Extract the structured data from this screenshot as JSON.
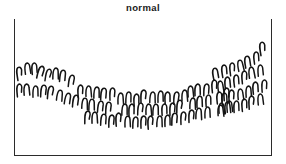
{
  "figure": {
    "title": "normal",
    "width": 286,
    "height": 164,
    "background_color": "#ffffff"
  },
  "axes": {
    "frame_style": "open-top",
    "frame_color": "#2b2b2b",
    "left_px": 14,
    "top_px": 19,
    "width_px": 258,
    "height_px": 137,
    "sides_drawn": [
      "left",
      "right",
      "bottom"
    ],
    "ticks": [],
    "tick_labels": [],
    "xlabel": "",
    "ylabel": ""
  },
  "marker": {
    "glyph_name": "inverted-u-hook",
    "description": "hand drawn inverted U hook stroke",
    "stroke_color": "#141414",
    "stroke_width": 1.5
  },
  "chart_data": {
    "type": "scatter",
    "title": "normal",
    "subtitle": "",
    "xlabel": "",
    "ylabel": "",
    "xlim": [
      0,
      258
    ],
    "ylim": [
      0,
      137
    ],
    "grid": false,
    "legend": null,
    "legend_position": "none",
    "annotations": [],
    "marker_style": "inverted-u-hook",
    "shape": "u-shaped band",
    "n_points": 94,
    "points": [
      {
        "x": 6,
        "y": 55,
        "r": -8,
        "s": 1.02
      },
      {
        "x": 13,
        "y": 50,
        "r": -6,
        "s": 1.0
      },
      {
        "x": 20,
        "y": 50,
        "r": -4,
        "s": 0.98
      },
      {
        "x": 27,
        "y": 54,
        "r": 14,
        "s": 1.04
      },
      {
        "x": 34,
        "y": 56,
        "r": 10,
        "s": 0.96
      },
      {
        "x": 41,
        "y": 55,
        "r": 2,
        "s": 1.0
      },
      {
        "x": 49,
        "y": 58,
        "r": 6,
        "s": 1.02
      },
      {
        "x": 57,
        "y": 62,
        "r": 8,
        "s": 0.98
      },
      {
        "x": 5,
        "y": 71,
        "r": -4,
        "s": 1.0
      },
      {
        "x": 13,
        "y": 72,
        "r": -2,
        "s": 1.02
      },
      {
        "x": 21,
        "y": 73,
        "r": 0,
        "s": 0.98
      },
      {
        "x": 29,
        "y": 72,
        "r": 4,
        "s": 1.0
      },
      {
        "x": 37,
        "y": 74,
        "r": 6,
        "s": 1.02
      },
      {
        "x": 45,
        "y": 77,
        "r": 8,
        "s": 0.98
      },
      {
        "x": 53,
        "y": 80,
        "r": 10,
        "s": 1.0
      },
      {
        "x": 62,
        "y": 83,
        "r": 6,
        "s": 1.02
      },
      {
        "x": 66,
        "y": 72,
        "r": -2,
        "s": 1.0
      },
      {
        "x": 74,
        "y": 73,
        "r": 0,
        "s": 0.98
      },
      {
        "x": 82,
        "y": 74,
        "r": 2,
        "s": 1.0
      },
      {
        "x": 90,
        "y": 76,
        "r": 4,
        "s": 1.02
      },
      {
        "x": 98,
        "y": 75,
        "r": 0,
        "s": 0.98
      },
      {
        "x": 70,
        "y": 85,
        "r": 4,
        "s": 1.0
      },
      {
        "x": 78,
        "y": 87,
        "r": 2,
        "s": 1.02
      },
      {
        "x": 86,
        "y": 88,
        "r": 6,
        "s": 0.98
      },
      {
        "x": 94,
        "y": 89,
        "r": 3,
        "s": 1.0
      },
      {
        "x": 73,
        "y": 98,
        "r": 2,
        "s": 1.0
      },
      {
        "x": 81,
        "y": 100,
        "r": 0,
        "s": 1.02
      },
      {
        "x": 89,
        "y": 101,
        "r": 4,
        "s": 0.98
      },
      {
        "x": 97,
        "y": 102,
        "r": 2,
        "s": 1.0
      },
      {
        "x": 105,
        "y": 101,
        "r": -2,
        "s": 1.02
      },
      {
        "x": 106,
        "y": 80,
        "r": 0,
        "s": 1.0
      },
      {
        "x": 114,
        "y": 79,
        "r": 2,
        "s": 0.98
      },
      {
        "x": 122,
        "y": 81,
        "r": -2,
        "s": 1.0
      },
      {
        "x": 130,
        "y": 78,
        "r": 0,
        "s": 1.02
      },
      {
        "x": 138,
        "y": 79,
        "r": 3,
        "s": 0.98
      },
      {
        "x": 146,
        "y": 78,
        "r": 0,
        "s": 1.0
      },
      {
        "x": 154,
        "y": 80,
        "r": -2,
        "s": 1.02
      },
      {
        "x": 162,
        "y": 79,
        "r": 2,
        "s": 0.98
      },
      {
        "x": 170,
        "y": 77,
        "r": 0,
        "s": 1.0
      },
      {
        "x": 110,
        "y": 91,
        "r": 2,
        "s": 1.0
      },
      {
        "x": 118,
        "y": 92,
        "r": 0,
        "s": 1.02
      },
      {
        "x": 126,
        "y": 90,
        "r": 3,
        "s": 0.98
      },
      {
        "x": 134,
        "y": 91,
        "r": 0,
        "s": 1.0
      },
      {
        "x": 142,
        "y": 92,
        "r": 2,
        "s": 1.02
      },
      {
        "x": 150,
        "y": 91,
        "r": -2,
        "s": 0.98
      },
      {
        "x": 158,
        "y": 90,
        "r": 0,
        "s": 1.0
      },
      {
        "x": 166,
        "y": 88,
        "r": 2,
        "s": 1.02
      },
      {
        "x": 113,
        "y": 103,
        "r": 0,
        "s": 1.0
      },
      {
        "x": 121,
        "y": 104,
        "r": 2,
        "s": 0.98
      },
      {
        "x": 129,
        "y": 103,
        "r": 0,
        "s": 1.0
      },
      {
        "x": 137,
        "y": 104,
        "r": -2,
        "s": 1.02
      },
      {
        "x": 145,
        "y": 103,
        "r": 2,
        "s": 0.98
      },
      {
        "x": 153,
        "y": 102,
        "r": 0,
        "s": 1.0
      },
      {
        "x": 161,
        "y": 101,
        "r": 2,
        "s": 1.02
      },
      {
        "x": 169,
        "y": 99,
        "r": 0,
        "s": 0.98
      },
      {
        "x": 176,
        "y": 73,
        "r": -2,
        "s": 1.0
      },
      {
        "x": 184,
        "y": 72,
        "r": 0,
        "s": 1.02
      },
      {
        "x": 192,
        "y": 71,
        "r": 2,
        "s": 0.98
      },
      {
        "x": 200,
        "y": 67,
        "r": -4,
        "s": 1.0
      },
      {
        "x": 178,
        "y": 85,
        "r": 2,
        "s": 1.0
      },
      {
        "x": 186,
        "y": 84,
        "r": 0,
        "s": 1.02
      },
      {
        "x": 194,
        "y": 82,
        "r": -2,
        "s": 0.98
      },
      {
        "x": 177,
        "y": 97,
        "r": 0,
        "s": 1.0
      },
      {
        "x": 185,
        "y": 96,
        "r": 2,
        "s": 1.02
      },
      {
        "x": 193,
        "y": 94,
        "r": 0,
        "s": 0.98
      },
      {
        "x": 205,
        "y": 79,
        "r": -4,
        "s": 1.0
      },
      {
        "x": 213,
        "y": 76,
        "r": -2,
        "s": 1.02
      },
      {
        "x": 207,
        "y": 90,
        "r": -2,
        "s": 0.98
      },
      {
        "x": 215,
        "y": 88,
        "r": -4,
        "s": 1.0
      },
      {
        "x": 202,
        "y": 56,
        "r": -10,
        "s": 1.02
      },
      {
        "x": 210,
        "y": 52,
        "r": -8,
        "s": 1.0
      },
      {
        "x": 218,
        "y": 50,
        "r": -6,
        "s": 0.98
      },
      {
        "x": 226,
        "y": 47,
        "r": -10,
        "s": 1.0
      },
      {
        "x": 234,
        "y": 44,
        "r": -8,
        "s": 1.02
      },
      {
        "x": 242,
        "y": 39,
        "r": -6,
        "s": 0.98
      },
      {
        "x": 249,
        "y": 30,
        "r": -8,
        "s": 1.04
      },
      {
        "x": 206,
        "y": 68,
        "r": -6,
        "s": 1.0
      },
      {
        "x": 214,
        "y": 65,
        "r": -4,
        "s": 1.02
      },
      {
        "x": 222,
        "y": 62,
        "r": -6,
        "s": 0.98
      },
      {
        "x": 230,
        "y": 58,
        "r": -4,
        "s": 1.0
      },
      {
        "x": 238,
        "y": 55,
        "r": -6,
        "s": 1.02
      },
      {
        "x": 246,
        "y": 52,
        "r": -4,
        "s": 0.98
      },
      {
        "x": 210,
        "y": 80,
        "r": -4,
        "s": 1.0
      },
      {
        "x": 218,
        "y": 78,
        "r": -2,
        "s": 1.02
      },
      {
        "x": 226,
        "y": 76,
        "r": -4,
        "s": 0.98
      },
      {
        "x": 234,
        "y": 73,
        "r": -2,
        "s": 1.0
      },
      {
        "x": 242,
        "y": 70,
        "r": -4,
        "s": 1.02
      },
      {
        "x": 250,
        "y": 67,
        "r": -2,
        "s": 0.98
      },
      {
        "x": 206,
        "y": 92,
        "r": -2,
        "s": 1.0
      },
      {
        "x": 214,
        "y": 90,
        "r": -4,
        "s": 1.02
      },
      {
        "x": 222,
        "y": 88,
        "r": -2,
        "s": 0.98
      },
      {
        "x": 230,
        "y": 86,
        "r": -4,
        "s": 1.0
      },
      {
        "x": 238,
        "y": 84,
        "r": -2,
        "s": 1.02
      },
      {
        "x": 246,
        "y": 81,
        "r": -4,
        "s": 0.98
      }
    ]
  }
}
